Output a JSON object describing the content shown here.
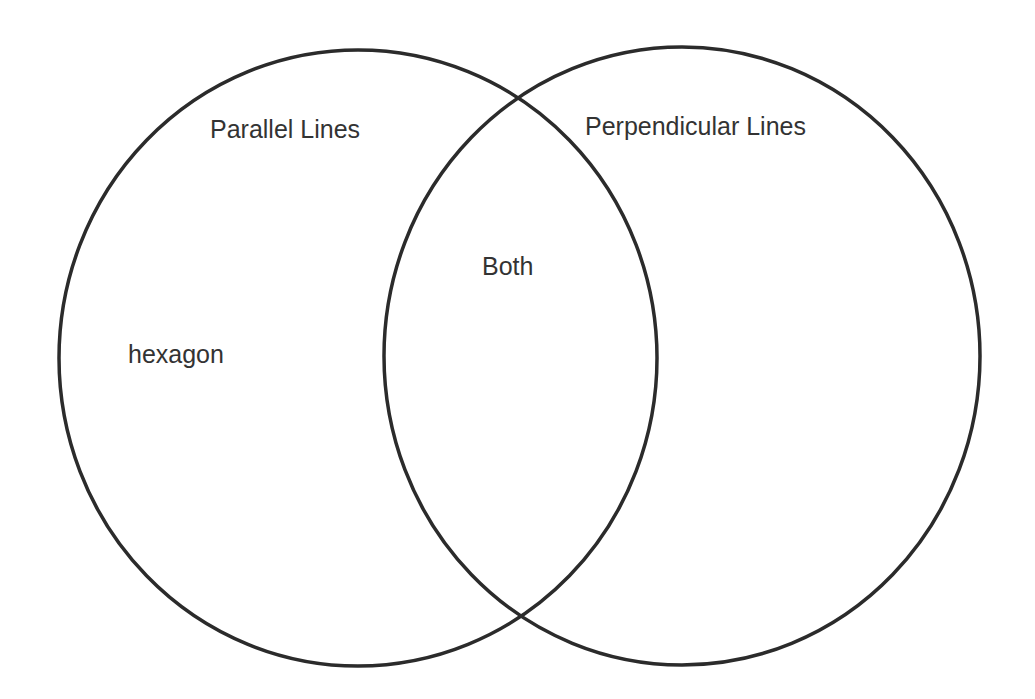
{
  "diagram": {
    "type": "venn",
    "stroke_color": "#2b2b2b",
    "text_color": "#333333",
    "background": "#ffffff",
    "sets": [
      {
        "id": "left",
        "label": "Parallel Lines",
        "shape": {
          "cx": 358,
          "cy": 358,
          "rx": 299,
          "ry": 308
        }
      },
      {
        "id": "right",
        "label": "Perpendicular Lines",
        "shape": {
          "cx": 682,
          "cy": 356,
          "rx": 298,
          "ry": 309
        }
      }
    ],
    "intersection": {
      "label": "Both",
      "items": []
    },
    "regions": {
      "left_only": {
        "items": [
          "hexagon"
        ]
      },
      "right_only": {
        "items": []
      }
    }
  }
}
